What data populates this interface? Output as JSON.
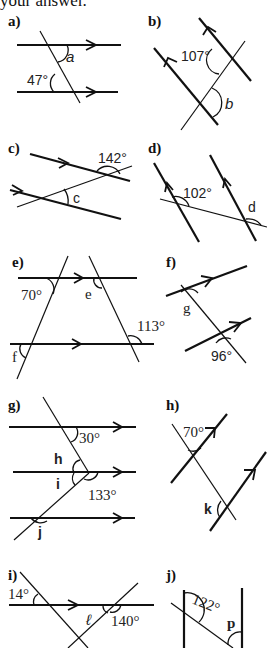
{
  "header": {
    "text": "your answer."
  },
  "problems": [
    {
      "id": "a",
      "label": "a)",
      "given": "47°",
      "unknown": "a"
    },
    {
      "id": "b",
      "label": "b)",
      "given": "107°",
      "unknown": "b"
    },
    {
      "id": "c",
      "label": "c)",
      "given": "142°",
      "unknown": "c"
    },
    {
      "id": "d",
      "label": "d)",
      "given": "102°",
      "unknown": "d"
    },
    {
      "id": "e",
      "label": "e)",
      "given": [
        "70°",
        "113°"
      ],
      "unknown": [
        "e",
        "f"
      ]
    },
    {
      "id": "f",
      "label": "f)",
      "given": "96°",
      "unknown": "g"
    },
    {
      "id": "g",
      "label": "g)",
      "given": [
        "30°",
        "133°"
      ],
      "unknown": [
        "h",
        "i",
        "j"
      ]
    },
    {
      "id": "h",
      "label": "h)",
      "given": "70°",
      "unknown": "k"
    },
    {
      "id": "i",
      "label": "i)",
      "given": [
        "14°",
        "140°"
      ],
      "unknown": "ℓ"
    },
    {
      "id": "j",
      "label": "j)",
      "given": "122°",
      "unknown": "p"
    }
  ],
  "text": {
    "a_label": "a)",
    "a_given": "47°",
    "a_var": "a",
    "b_label": "b)",
    "b_given": "107°",
    "b_var": "b",
    "c_label": "c)",
    "c_given": "142°",
    "c_var": "c",
    "d_label": "d)",
    "d_given": "102°",
    "d_var": "d",
    "e_label": "e)",
    "e_given1": "70°",
    "e_given2": "113°",
    "e_var1": "e",
    "e_var2": "f",
    "f_label": "f)",
    "f_given": "96°",
    "f_var": "g",
    "g_label": "g)",
    "g_given1": "30°",
    "g_given2": "133°",
    "g_var1": "h",
    "g_var2": "i",
    "g_var3": "j",
    "h_label": "h)",
    "h_given": "70°",
    "h_var": "k",
    "i_label": "i)",
    "i_given1": "14°",
    "i_given2": "140°",
    "i_var": "ℓ",
    "j_label": "j)",
    "j_given": "122°",
    "j_var": "p"
  }
}
